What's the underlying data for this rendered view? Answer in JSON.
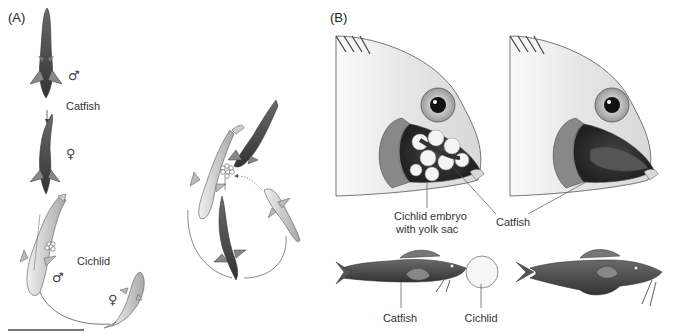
{
  "panel_a": {
    "label": "(A)",
    "catfish_label": "Catfish",
    "cichlid_label": "Cichlid",
    "male_symbol": "♂",
    "female_symbol": "♀",
    "catfish_male_symbol": "♂",
    "catfish_female_symbol": "♀",
    "cichlid_male_symbol": "♂",
    "cichlid_female_symbol": "♀"
  },
  "panel_b": {
    "label": "(B)",
    "cichlid_embryo_label_line1": "Cichlid embryo",
    "cichlid_embryo_label_line2": "with yolk sac",
    "catfish_label_top": "Catfish",
    "catfish_label_bottom": "Catfish",
    "cichlid_label_bottom": "Cichlid"
  },
  "colors": {
    "catfish_body": "#4a4a4a",
    "cichlid_body": "#c8c8c8",
    "head_fill": "#e2e2e2",
    "line": "#555555"
  }
}
